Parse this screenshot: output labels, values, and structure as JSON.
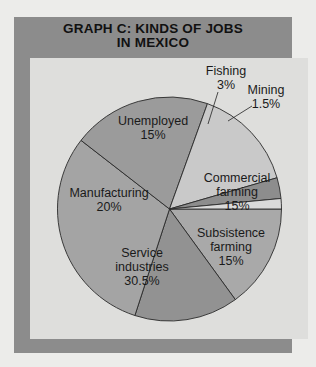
{
  "title": {
    "line1": "GRAPH C: KINDS OF JOBS",
    "line2": "IN MEXICO"
  },
  "chart_data": {
    "type": "pie",
    "title": "GRAPH C: KINDS OF JOBS IN MEXICO",
    "categories": [
      "Commercial farming",
      "Subsistence farming",
      "Service industries",
      "Manufacturing",
      "Unemployed",
      "Fishing",
      "Mining"
    ],
    "values": [
      15,
      15,
      30.5,
      20,
      15,
      3,
      1.5
    ],
    "unit": "%",
    "colors": [
      "#a9a9a9",
      "#929292",
      "#a4a4a4",
      "#9b9b9b",
      "#c9c9c9",
      "#8d8d8d",
      "#dadada"
    ],
    "legend": "none (direct labels)"
  },
  "labels": {
    "fishing": {
      "name": "Fishing",
      "value": "3%"
    },
    "mining": {
      "name": "Mining",
      "value": "1.5%"
    },
    "unemployed": {
      "name": "Unemployed",
      "value": "15%"
    },
    "manufacturing": {
      "name": "Manufacturing",
      "value": "20%"
    },
    "commercial": {
      "name1": "Commercial",
      "name2": "farming",
      "value": "15%"
    },
    "subsistence": {
      "name1": "Subsistence",
      "name2": "farming",
      "value": "15%"
    },
    "service": {
      "name1": "Service",
      "name2": "industries",
      "value": "30.5%"
    }
  }
}
